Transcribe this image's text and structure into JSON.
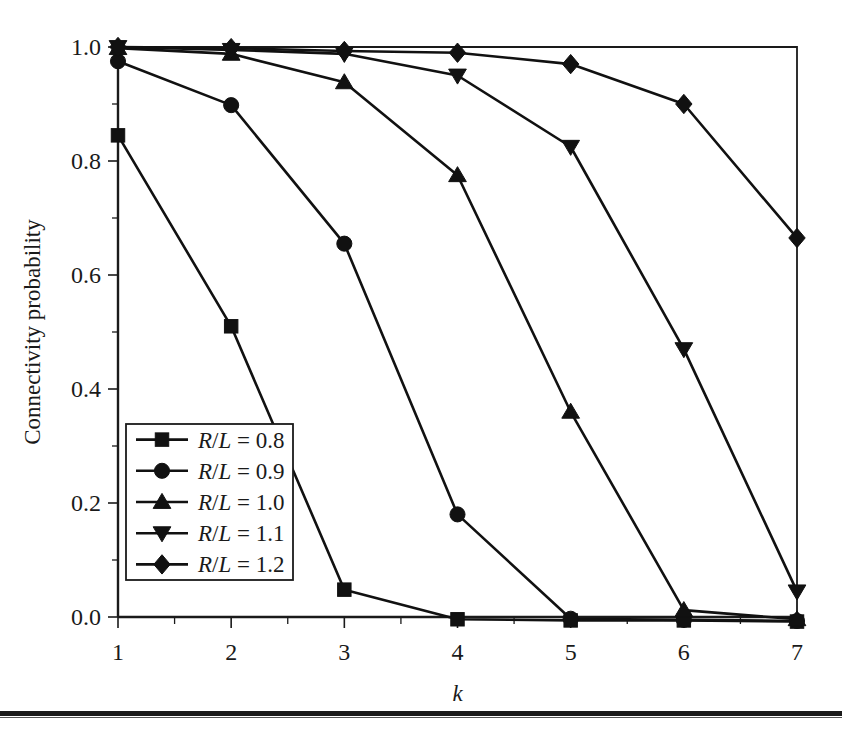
{
  "chart_data": {
    "type": "line",
    "title": "",
    "xlabel": "k",
    "ylabel": "Connectivity probability",
    "x": [
      1,
      2,
      3,
      4,
      5,
      6,
      7
    ],
    "xlim": [
      1,
      7
    ],
    "ylim": [
      0.0,
      1.0
    ],
    "xticks": [
      "1",
      "2",
      "3",
      "4",
      "5",
      "6",
      "7"
    ],
    "yticks": [
      "0.0",
      "0.2",
      "0.4",
      "0.6",
      "0.8",
      "1.0"
    ],
    "ytick_values": [
      0.0,
      0.2,
      0.4,
      0.6,
      0.8,
      1.0
    ],
    "minor_tick_interval_y": 0.1,
    "minor_tick_interval_x": 0.5,
    "grid": false,
    "legend_position": "lower-left-inside",
    "line_color": "#111111",
    "marker_color": "#111111",
    "series": [
      {
        "name": "R/L = 0.8",
        "label_prefix": "R",
        "label_sep": "/",
        "label_mid": "L",
        "label_suffix": " = 0.8",
        "marker": "square",
        "values": [
          0.845,
          0.51,
          0.048,
          -0.004,
          -0.006,
          -0.006,
          -0.008
        ]
      },
      {
        "name": "R/L = 0.9",
        "label_prefix": "R",
        "label_sep": "/",
        "label_mid": "L",
        "label_suffix": " = 0.9",
        "marker": "circle",
        "values": [
          0.975,
          0.898,
          0.655,
          0.18,
          -0.003,
          -0.005,
          -0.007
        ]
      },
      {
        "name": "R/L = 1.0",
        "label_prefix": "R",
        "label_sep": "/",
        "label_mid": "L",
        "label_suffix": " = 1.0",
        "marker": "triangle-up",
        "values": [
          0.998,
          0.988,
          0.938,
          0.775,
          0.36,
          0.012,
          -0.004
        ]
      },
      {
        "name": "R/L = 1.1",
        "label_prefix": "R",
        "label_sep": "/",
        "label_mid": "L",
        "label_suffix": " = 1.1",
        "marker": "triangle-down",
        "values": [
          1.0,
          0.995,
          0.988,
          0.95,
          0.825,
          0.47,
          0.045
        ]
      },
      {
        "name": "R/L = 1.2",
        "label_prefix": "R",
        "label_sep": "/",
        "label_mid": "L",
        "label_suffix": " = 1.2",
        "marker": "diamond",
        "values": [
          1.0,
          0.998,
          0.993,
          0.99,
          0.97,
          0.9,
          0.665
        ]
      }
    ]
  }
}
